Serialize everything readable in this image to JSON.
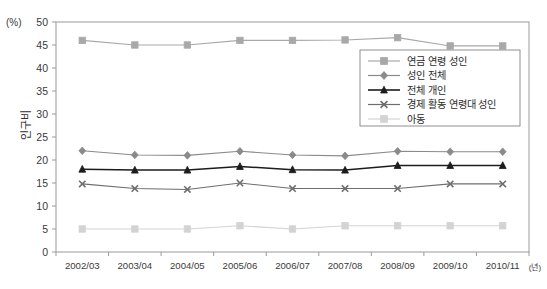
{
  "chart_data": {
    "type": "line",
    "title": "",
    "subtitle": "",
    "xlabel": "",
    "ylabel": "인구비",
    "y_unit": "(%)",
    "x_unit": "(년)",
    "ylim": [
      0,
      50
    ],
    "ytick_step": 5,
    "grid": false,
    "legend_position": "inside-top-right",
    "categories": [
      "2002/03",
      "2003/04",
      "2004/05",
      "2005/06",
      "2006/07",
      "2007/08",
      "2008/09",
      "2009/10",
      "2010/11"
    ],
    "yticks": [
      0,
      5,
      10,
      15,
      20,
      25,
      30,
      35,
      40,
      45,
      50
    ],
    "series": [
      {
        "name": "연금 연령 성인",
        "marker": "square",
        "color": "#a8a8a8",
        "values": [
          46.0,
          45.0,
          45.0,
          46.0,
          46.0,
          46.1,
          46.6,
          44.8,
          44.8
        ]
      },
      {
        "name": "성인 전체",
        "marker": "diamond",
        "color": "#8a8a8a",
        "values": [
          22.0,
          21.1,
          21.0,
          21.9,
          21.1,
          20.9,
          21.9,
          21.8,
          21.8
        ]
      },
      {
        "name": "전체 개인",
        "marker": "triangle",
        "color": "#1c1c1c",
        "values": [
          18.0,
          17.8,
          17.8,
          18.6,
          17.9,
          17.8,
          18.8,
          18.8,
          18.8
        ]
      },
      {
        "name": "경제 활동 연령대 성인",
        "marker": "x",
        "color": "#6e6e6e",
        "values": [
          14.8,
          13.8,
          13.6,
          15.0,
          13.8,
          13.8,
          13.8,
          14.8,
          14.8
        ]
      },
      {
        "name": "아동",
        "marker": "square",
        "color": "#d3d3d3",
        "values": [
          5.0,
          5.0,
          5.0,
          5.7,
          5.0,
          5.7,
          5.7,
          5.7,
          5.7
        ]
      }
    ]
  },
  "legend": {
    "items": [
      "연금 연령 성인",
      "성인 전체",
      "전체 개인",
      "경제 활동 연령대 성인",
      "아동"
    ]
  }
}
